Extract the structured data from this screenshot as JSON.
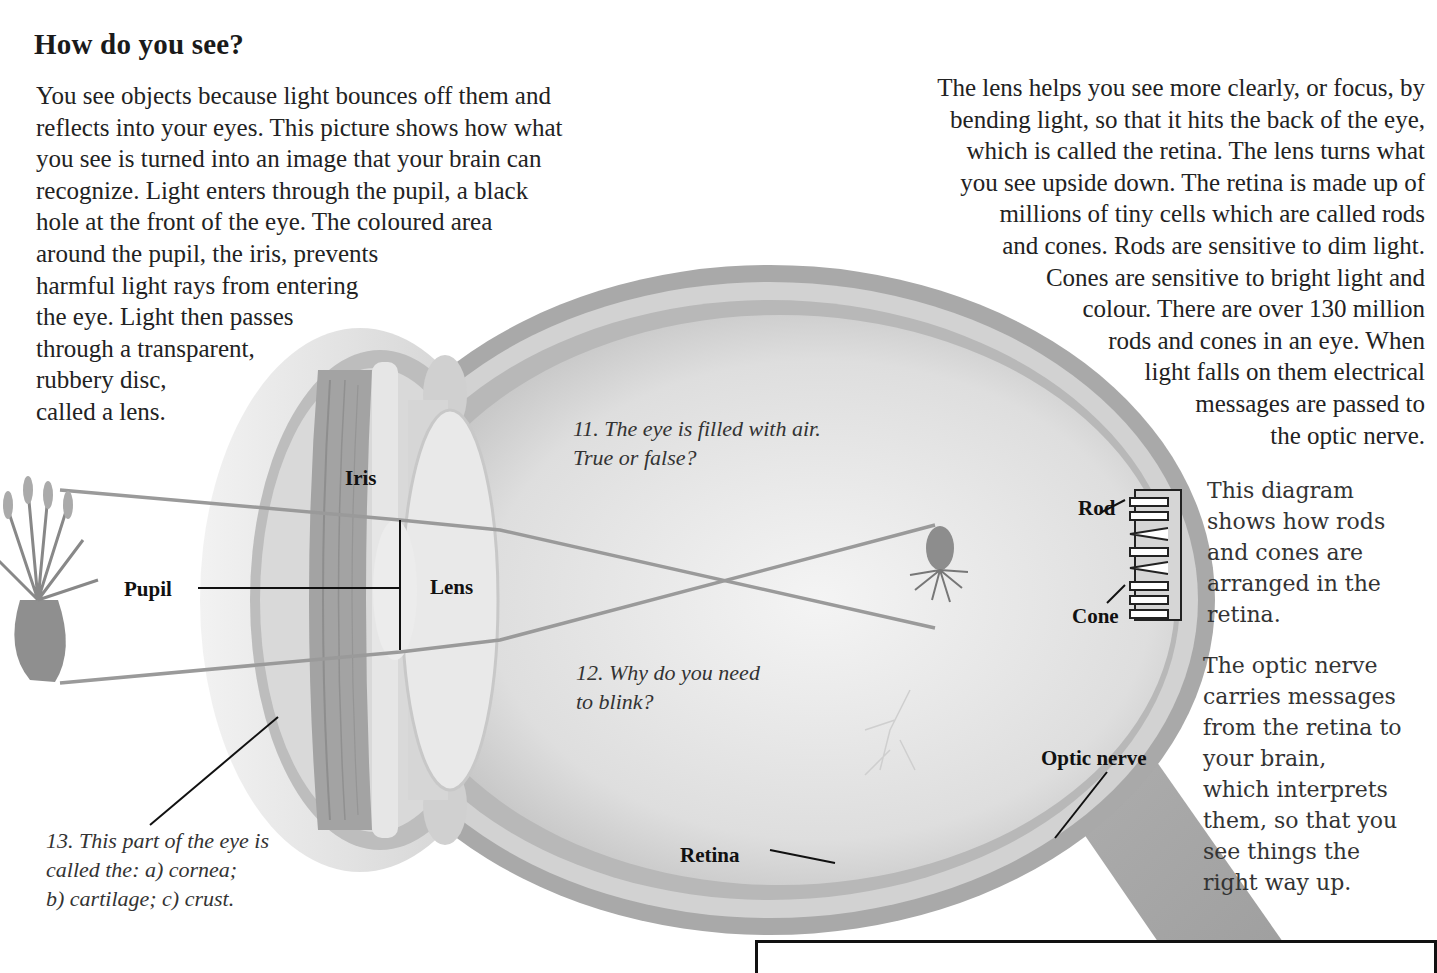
{
  "page": {
    "title": "How do you see?",
    "intro_left": [
      "You see objects because light bounces off them and",
      "reflects into your eyes. This picture shows how what",
      "you see is turned into an image that your brain can",
      "recognize. Light enters through the pupil, a black",
      "hole at the front of the eye. The coloured area",
      "around the pupil, the iris, prevents",
      "harmful light rays from entering",
      "the eye. Light then passes",
      "through a transparent,",
      "rubbery disc,",
      "called a lens."
    ],
    "intro_right": [
      "The lens helps you see more clearly, or focus, by",
      "bending light, so that it hits the back of the eye,",
      "which is called the retina. The lens turns what",
      "you see upside down. The retina is made up of",
      "millions of tiny cells which are called rods",
      "and cones. Rods are sensitive to dim light.",
      "Cones are sensitive to bright light and",
      "colour. There are over 130 million",
      "rods and cones in an eye. When",
      "light falls on them electrical",
      "messages are passed to",
      "the optic nerve."
    ]
  },
  "diagram": {
    "labels": {
      "iris": "Iris",
      "pupil": "Pupil",
      "lens": "Lens",
      "retina": "Retina",
      "optic_nerve": "Optic nerve",
      "rod": "Rod",
      "cone": "Cone"
    },
    "colors": {
      "eye_outer": "#a8a8a8",
      "eye_inner": "#e4e4e4",
      "sclera_band": "#cfcfcf",
      "light_ray": "#9a9a9a",
      "nerve": "#a9a9a9"
    }
  },
  "questions": {
    "q11": [
      "11. The eye is filled with air.",
      "True or false?"
    ],
    "q12": [
      "12. Why do you need",
      "to blink?"
    ],
    "q13": [
      "13. This part of the eye is",
      "called the: a) cornea;",
      "b) cartilage; c) crust."
    ]
  },
  "sidebar": {
    "rods_cones_text": [
      "This diagram",
      "shows how rods",
      "and cones are",
      "arranged in the",
      "retina."
    ],
    "optic_nerve_text": [
      "The optic nerve",
      "carries messages",
      "from the retina to",
      "your brain,",
      "which interprets",
      "them, so that you",
      "see things the",
      "right way up."
    ]
  }
}
